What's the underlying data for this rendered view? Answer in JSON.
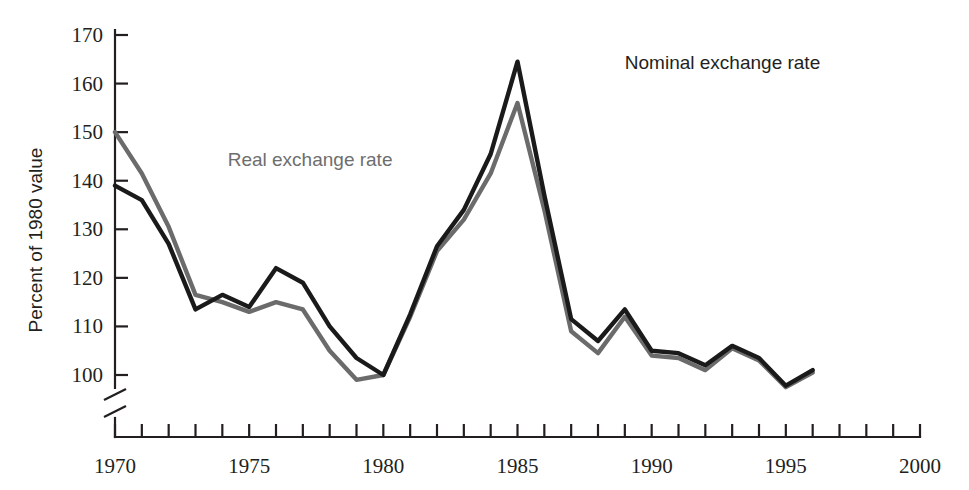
{
  "chart_data": {
    "type": "line",
    "title": "",
    "xlabel": "",
    "ylabel": "Percent of 1980 value",
    "xlim": [
      1970,
      2000
    ],
    "ylim": [
      95,
      170
    ],
    "y_axis_break": true,
    "y_break_below": 100,
    "grid": false,
    "legend_position": "inline-annotations",
    "xticks": [
      1970,
      1971,
      1972,
      1973,
      1974,
      1975,
      1976,
      1977,
      1978,
      1979,
      1980,
      1981,
      1982,
      1983,
      1984,
      1985,
      1986,
      1987,
      1988,
      1989,
      1990,
      1991,
      1992,
      1993,
      1994,
      1995,
      1996,
      1997,
      1998,
      1999,
      2000
    ],
    "xtick_labels": [
      "1970",
      "1975",
      "1980",
      "1985",
      "1990",
      "1995",
      "2000"
    ],
    "xtick_label_values": [
      1970,
      1975,
      1980,
      1985,
      1990,
      1995,
      2000
    ],
    "yticks": [
      100,
      110,
      120,
      130,
      140,
      150,
      160,
      170
    ],
    "ytick_labels": [
      "100",
      "110",
      "120",
      "130",
      "140",
      "150",
      "160",
      "170"
    ],
    "x": [
      1970,
      1971,
      1972,
      1973,
      1974,
      1975,
      1976,
      1977,
      1978,
      1979,
      1980,
      1981,
      1982,
      1983,
      1984,
      1985,
      1986,
      1987,
      1988,
      1989,
      1990,
      1991,
      1992,
      1993,
      1994,
      1995,
      1996
    ],
    "series": [
      {
        "name": "Nominal exchange rate",
        "color": "#1a1a1a",
        "label_x": 1989,
        "label_y": 163,
        "values": [
          139.0,
          136.0,
          127.0,
          113.5,
          116.5,
          114.0,
          122.0,
          119.0,
          110.0,
          103.5,
          100.0,
          112.5,
          126.5,
          134.0,
          145.5,
          164.5,
          137.0,
          111.5,
          107.0,
          113.5,
          105.0,
          104.5,
          102.0,
          106.0,
          103.5,
          97.8,
          101.0
        ]
      },
      {
        "name": "Real exchange rate",
        "color": "#6b6b6b",
        "label_x": 1974.2,
        "label_y": 143,
        "values": [
          150.0,
          141.5,
          130.5,
          116.5,
          115.0,
          113.0,
          115.0,
          113.5,
          105.0,
          99.0,
          100.0,
          112.0,
          125.5,
          132.0,
          141.5,
          156.0,
          134.0,
          109.0,
          104.5,
          112.0,
          104.0,
          103.5,
          101.0,
          105.5,
          103.0,
          97.5,
          100.5
        ]
      }
    ]
  },
  "annotations": {
    "nominal_label": "Nominal exchange rate",
    "real_label": "Real exchange rate"
  }
}
